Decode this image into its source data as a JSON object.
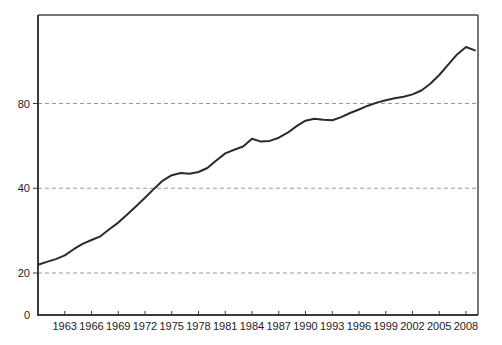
{
  "page": {
    "background_color": "#ffffff",
    "title": ""
  },
  "chart_data": {
    "type": "line",
    "title": "",
    "xlabel": "",
    "ylabel": "",
    "y_scale": "log2",
    "x_range": [
      1960,
      2009.5
    ],
    "y_gridlines": [
      20,
      40,
      80
    ],
    "y_tick_labels": [
      "20",
      "40",
      "80"
    ],
    "origin_label": "0",
    "x_tick_years": [
      1963,
      1966,
      1969,
      1972,
      1975,
      1978,
      1981,
      1984,
      1987,
      1990,
      1993,
      1996,
      1999,
      2002,
      2005,
      2008
    ],
    "x_tick_labels": [
      "1963",
      "1966",
      "1969",
      "1972",
      "1975",
      "1978",
      "1981",
      "1984",
      "1987",
      "1990",
      "1993",
      "1996",
      "1999",
      "2002",
      "2005",
      "2008"
    ],
    "series": [
      {
        "name": "series-1",
        "x": [
          1960,
          1961,
          1962,
          1963,
          1964,
          1965,
          1966,
          1967,
          1968,
          1969,
          1970,
          1971,
          1972,
          1973,
          1974,
          1975,
          1976,
          1977,
          1978,
          1979,
          1980,
          1981,
          1982,
          1983,
          1984,
          1985,
          1986,
          1987,
          1988,
          1989,
          1990,
          1991,
          1992,
          1993,
          1994,
          1995,
          1996,
          1997,
          1998,
          1999,
          2000,
          2001,
          2002,
          2003,
          2004,
          2005,
          2006,
          2007,
          2008,
          2009
        ],
        "values": [
          21.4,
          21.9,
          22.4,
          23.1,
          24.3,
          25.4,
          26.2,
          27.0,
          28.6,
          30.2,
          32.3,
          34.5,
          37.0,
          39.8,
          42.6,
          44.5,
          45.3,
          45.0,
          45.7,
          47.2,
          50.2,
          53.2,
          54.8,
          56.3,
          60.0,
          58.6,
          58.9,
          60.5,
          63.0,
          66.5,
          69.5,
          70.6,
          70.0,
          69.8,
          71.6,
          74.0,
          76.2,
          78.6,
          80.6,
          82.2,
          83.5,
          84.6,
          86.2,
          89.0,
          94.0,
          101.0,
          110.0,
          119.5,
          127.0,
          123.5
        ]
      }
    ],
    "colors": {
      "line": "#2b2b2b",
      "grid": "#999999",
      "axis": "#3a3a3a",
      "frame": "#4a4a4a",
      "tick": "#3a3a3a",
      "label": "#222222"
    },
    "style": {
      "grid_dash": "4 3",
      "line_width": 2,
      "legend": "none"
    }
  }
}
